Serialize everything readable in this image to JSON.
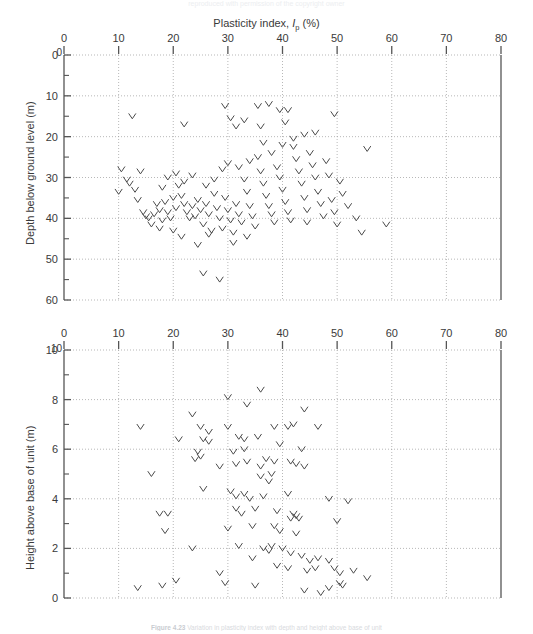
{
  "figure": {
    "cut_header": "reproduced with permission of the copyright owner",
    "caption_bold": "Figure 4.23",
    "caption_rest": "Variation in plasticity index with depth and height above base of unit"
  },
  "shared_x": {
    "title_prefix": "Plasticity index, ",
    "title_symbol": "I",
    "title_subscript": "p",
    "title_suffix": " (%)",
    "ticks": [
      0,
      10,
      20,
      30,
      40,
      50,
      60,
      70,
      80
    ],
    "min": 0,
    "max": 80
  },
  "style": {
    "axis_color": "#555555",
    "grid_color": "#9a9a9a",
    "marker_color": "#4a4a4a",
    "text_color": "#3a3a3a"
  },
  "chart_data": [
    {
      "type": "scatter",
      "id": "depth-panel",
      "title": "",
      "xlabel": "Plasticity index, Ip (%)",
      "ylabel": "Depth below ground level (m)",
      "xlim": [
        0,
        80
      ],
      "ylim": [
        0,
        60
      ],
      "y_inverted": true,
      "xticks": [
        0,
        10,
        20,
        30,
        40,
        50,
        60,
        70,
        80
      ],
      "yticks": [
        0,
        10,
        20,
        30,
        40,
        50,
        60
      ],
      "y_minor_step": 5,
      "grid": "dotted",
      "corner_label": "0",
      "marker": "V",
      "points": [
        [
          12.5,
          15.0
        ],
        [
          22.0,
          17.0
        ],
        [
          29.5,
          12.5
        ],
        [
          30.5,
          15.5
        ],
        [
          31.5,
          17.5
        ],
        [
          33.0,
          16.0
        ],
        [
          35.5,
          12.5
        ],
        [
          37.5,
          12.0
        ],
        [
          39.5,
          13.5
        ],
        [
          41.0,
          13.5
        ],
        [
          36.0,
          17.5
        ],
        [
          40.5,
          16.5
        ],
        [
          49.5,
          14.5
        ],
        [
          55.5,
          23.0
        ],
        [
          10.5,
          28.0
        ],
        [
          11.5,
          30.5
        ],
        [
          13.0,
          33.0
        ],
        [
          13.5,
          35.5
        ],
        [
          14.5,
          38.5
        ],
        [
          15.0,
          39.5
        ],
        [
          15.5,
          40.0
        ],
        [
          16.5,
          39.0
        ],
        [
          17.0,
          36.5
        ],
        [
          17.5,
          38.0
        ],
        [
          18.0,
          40.5
        ],
        [
          18.5,
          36.0
        ],
        [
          19.0,
          38.5
        ],
        [
          19.5,
          40.0
        ],
        [
          20.0,
          35.0
        ],
        [
          20.5,
          37.5
        ],
        [
          21.0,
          32.0
        ],
        [
          21.5,
          34.5
        ],
        [
          22.0,
          36.5
        ],
        [
          22.5,
          38.5
        ],
        [
          23.0,
          40.0
        ],
        [
          23.5,
          37.0
        ],
        [
          24.0,
          39.5
        ],
        [
          24.5,
          35.5
        ],
        [
          25.0,
          38.0
        ],
        [
          25.5,
          41.5
        ],
        [
          26.0,
          36.5
        ],
        [
          26.5,
          39.0
        ],
        [
          27.0,
          43.0
        ],
        [
          27.5,
          34.0
        ],
        [
          28.0,
          37.5
        ],
        [
          28.5,
          40.0
        ],
        [
          29.0,
          42.5
        ],
        [
          29.5,
          35.0
        ],
        [
          30.0,
          38.0
        ],
        [
          30.5,
          40.5
        ],
        [
          31.0,
          43.5
        ],
        [
          31.5,
          36.5
        ],
        [
          32.0,
          39.0
        ],
        [
          32.5,
          41.0
        ],
        [
          33.0,
          30.5
        ],
        [
          33.5,
          33.5
        ],
        [
          34.0,
          37.0
        ],
        [
          34.5,
          39.5
        ],
        [
          35.0,
          42.0
        ],
        [
          35.5,
          25.0
        ],
        [
          36.0,
          28.5
        ],
        [
          36.5,
          31.5
        ],
        [
          37.0,
          34.5
        ],
        [
          37.5,
          37.0
        ],
        [
          38.0,
          39.0
        ],
        [
          38.5,
          41.0
        ],
        [
          39.0,
          27.5
        ],
        [
          39.5,
          30.0
        ],
        [
          40.0,
          33.0
        ],
        [
          40.5,
          36.0
        ],
        [
          41.0,
          38.5
        ],
        [
          41.5,
          40.5
        ],
        [
          42.0,
          22.5
        ],
        [
          42.5,
          25.5
        ],
        [
          43.0,
          28.5
        ],
        [
          43.5,
          31.5
        ],
        [
          44.0,
          35.0
        ],
        [
          44.5,
          38.0
        ],
        [
          45.0,
          24.0
        ],
        [
          45.5,
          27.0
        ],
        [
          46.0,
          30.0
        ],
        [
          46.5,
          33.5
        ],
        [
          47.0,
          36.5
        ],
        [
          47.5,
          39.5
        ],
        [
          48.0,
          26.0
        ],
        [
          48.5,
          29.5
        ],
        [
          49.0,
          35.5
        ],
        [
          49.5,
          38.5
        ],
        [
          50.0,
          41.5
        ],
        [
          50.5,
          31.0
        ],
        [
          51.0,
          34.0
        ],
        [
          52.0,
          37.0
        ],
        [
          53.5,
          40.0
        ],
        [
          54.5,
          43.5
        ],
        [
          25.5,
          53.5
        ],
        [
          28.5,
          55.0
        ],
        [
          24.5,
          46.5
        ],
        [
          26.5,
          44.0
        ],
        [
          20.0,
          43.0
        ],
        [
          21.5,
          44.5
        ],
        [
          16.0,
          41.5
        ],
        [
          17.5,
          42.5
        ],
        [
          59.0,
          41.5
        ],
        [
          44.5,
          41.0
        ],
        [
          31.0,
          46.0
        ],
        [
          33.5,
          44.5
        ],
        [
          12.0,
          31.5
        ],
        [
          14.0,
          28.5
        ],
        [
          10.0,
          33.5
        ],
        [
          18.0,
          32.5
        ],
        [
          19.0,
          30.0
        ],
        [
          20.5,
          29.0
        ],
        [
          22.0,
          31.0
        ],
        [
          23.5,
          29.5
        ],
        [
          26.0,
          32.0
        ],
        [
          27.5,
          30.5
        ],
        [
          29.0,
          28.0
        ],
        [
          30.0,
          26.5
        ],
        [
          32.0,
          27.5
        ],
        [
          34.0,
          26.0
        ],
        [
          38.0,
          24.0
        ],
        [
          40.0,
          22.0
        ],
        [
          42.0,
          20.5
        ],
        [
          36.5,
          21.5
        ],
        [
          44.0,
          19.5
        ],
        [
          46.0,
          19.0
        ]
      ]
    },
    {
      "type": "scatter",
      "id": "height-panel",
      "title": "",
      "xlabel": "Plasticity index, Ip (%)",
      "ylabel": "Height above base of unit (m)",
      "xlim": [
        0,
        80
      ],
      "ylim": [
        0,
        10
      ],
      "y_inverted": false,
      "xticks": [
        0,
        10,
        20,
        30,
        40,
        50,
        60,
        70,
        80
      ],
      "yticks": [
        0,
        2,
        4,
        6,
        8,
        10
      ],
      "y_minor_step": 1,
      "grid": "dotted",
      "corner_label": "10",
      "marker": "V",
      "points": [
        [
          30.0,
          8.1
        ],
        [
          33.5,
          7.8
        ],
        [
          23.5,
          7.4
        ],
        [
          44.0,
          7.6
        ],
        [
          36.0,
          8.4
        ],
        [
          14.0,
          6.9
        ],
        [
          25.0,
          6.9
        ],
        [
          26.5,
          6.7
        ],
        [
          30.0,
          6.9
        ],
        [
          38.5,
          6.9
        ],
        [
          41.0,
          6.9
        ],
        [
          42.0,
          7.0
        ],
        [
          46.5,
          6.9
        ],
        [
          21.0,
          6.4
        ],
        [
          25.5,
          6.4
        ],
        [
          26.5,
          6.3
        ],
        [
          32.0,
          6.5
        ],
        [
          33.0,
          6.4
        ],
        [
          35.5,
          6.5
        ],
        [
          39.5,
          6.2
        ],
        [
          24.5,
          5.9
        ],
        [
          25.0,
          5.7
        ],
        [
          31.0,
          5.9
        ],
        [
          33.0,
          6.0
        ],
        [
          43.5,
          6.0
        ],
        [
          16.0,
          5.0
        ],
        [
          24.0,
          5.6
        ],
        [
          28.5,
          5.3
        ],
        [
          31.5,
          5.4
        ],
        [
          33.5,
          5.5
        ],
        [
          36.0,
          5.3
        ],
        [
          37.0,
          5.6
        ],
        [
          38.5,
          5.5
        ],
        [
          41.5,
          5.5
        ],
        [
          42.5,
          5.4
        ],
        [
          44.0,
          5.3
        ],
        [
          36.0,
          4.9
        ],
        [
          37.5,
          4.7
        ],
        [
          38.0,
          5.0
        ],
        [
          25.5,
          4.4
        ],
        [
          30.5,
          4.3
        ],
        [
          31.5,
          4.1
        ],
        [
          33.0,
          4.2
        ],
        [
          34.0,
          4.0
        ],
        [
          36.5,
          4.1
        ],
        [
          41.0,
          4.2
        ],
        [
          48.5,
          4.0
        ],
        [
          52.0,
          3.9
        ],
        [
          17.5,
          3.4
        ],
        [
          19.0,
          3.4
        ],
        [
          31.5,
          3.6
        ],
        [
          32.5,
          3.4
        ],
        [
          35.0,
          3.6
        ],
        [
          39.0,
          3.5
        ],
        [
          41.5,
          3.2
        ],
        [
          42.0,
          3.4
        ],
        [
          42.5,
          3.3
        ],
        [
          43.0,
          3.2
        ],
        [
          50.0,
          3.1
        ],
        [
          18.5,
          2.7
        ],
        [
          30.0,
          2.8
        ],
        [
          34.5,
          2.9
        ],
        [
          38.5,
          2.9
        ],
        [
          39.5,
          2.7
        ],
        [
          42.5,
          2.6
        ],
        [
          23.5,
          2.0
        ],
        [
          32.0,
          2.1
        ],
        [
          36.5,
          2.0
        ],
        [
          37.5,
          1.9
        ],
        [
          38.0,
          2.1
        ],
        [
          40.0,
          2.0
        ],
        [
          41.5,
          1.8
        ],
        [
          43.5,
          1.7
        ],
        [
          45.0,
          1.5
        ],
        [
          46.5,
          1.6
        ],
        [
          48.5,
          1.5
        ],
        [
          34.5,
          1.6
        ],
        [
          39.0,
          1.3
        ],
        [
          41.0,
          1.2
        ],
        [
          44.5,
          1.1
        ],
        [
          46.0,
          1.2
        ],
        [
          49.5,
          1.2
        ],
        [
          50.5,
          1.0
        ],
        [
          53.0,
          1.1
        ],
        [
          18.0,
          0.5
        ],
        [
          13.5,
          0.4
        ],
        [
          20.5,
          0.7
        ],
        [
          35.0,
          0.5
        ],
        [
          44.0,
          0.3
        ],
        [
          48.5,
          0.4
        ],
        [
          50.5,
          0.6
        ],
        [
          51.0,
          0.5
        ],
        [
          47.0,
          0.2
        ],
        [
          28.5,
          1.0
        ],
        [
          29.5,
          0.6
        ],
        [
          55.5,
          0.8
        ]
      ]
    }
  ]
}
